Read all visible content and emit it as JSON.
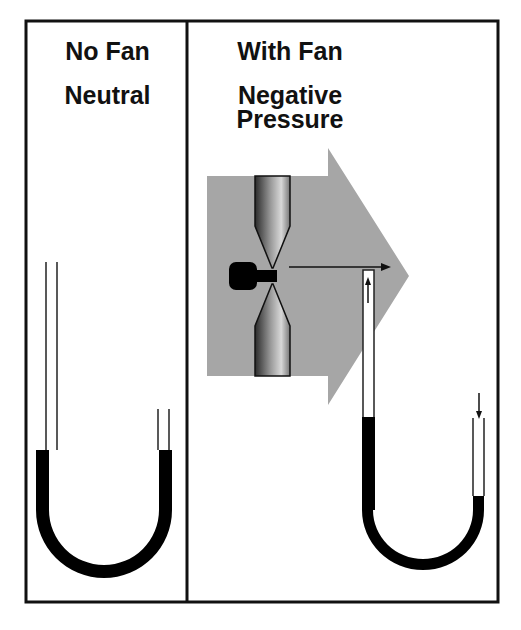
{
  "left_panel": {
    "title": "No Fan",
    "subtitle": "Neutral",
    "manometer": {
      "left_fluid_level": "equal",
      "right_fluid_level": "equal"
    }
  },
  "right_panel": {
    "title": "With Fan",
    "subtitle_line1": "Negative",
    "subtitle_line2": "Pressure",
    "fan": "fan-icon",
    "airflow_arrow": "airflow-arrow",
    "manometer": {
      "left_fluid_level": "lower-raised",
      "right_fluid_level": "lowered"
    }
  },
  "colors": {
    "border": "#111111",
    "fluid": "#000000",
    "airflow": "#a6a6a6",
    "background": "#ffffff"
  }
}
